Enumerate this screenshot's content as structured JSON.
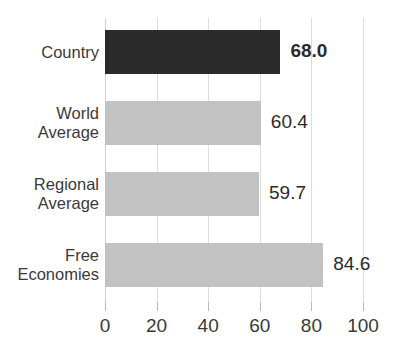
{
  "chart_data": {
    "type": "bar",
    "orientation": "horizontal",
    "title": "",
    "xlabel": "",
    "ylabel": "",
    "xlim": [
      0,
      100
    ],
    "categories": [
      "Country",
      "World Average",
      "Regional Average",
      "Free Economies"
    ],
    "values": [
      68.0,
      60.4,
      59.7,
      84.6
    ],
    "value_labels": [
      "68.0",
      "60.4",
      "59.7",
      "84.6"
    ],
    "xticks": [
      0,
      20,
      40,
      60,
      80,
      100
    ],
    "xtick_labels": [
      "0",
      "20",
      "40",
      "60",
      "80",
      "100"
    ],
    "grid": true,
    "legend": "none",
    "bar_colors": [
      "#2b2b2b",
      "#c2c2c2",
      "#c2c2c2",
      "#c2c2c2"
    ],
    "series": [
      {
        "name": "Score",
        "values": [
          68.0,
          60.4,
          59.7,
          84.6
        ]
      }
    ]
  },
  "chart": {
    "title_cropped": "",
    "bars": [
      {
        "label_lines": [
          "Country"
        ],
        "value_text": "68.0",
        "value": 68.0,
        "emphasis": true,
        "color": "#2b2b2b"
      },
      {
        "label_lines": [
          "World",
          "Average"
        ],
        "value_text": "60.4",
        "value": 60.4,
        "emphasis": false,
        "color": "#c2c2c2"
      },
      {
        "label_lines": [
          "Regional",
          "Average"
        ],
        "value_text": "59.7",
        "value": 59.7,
        "emphasis": false,
        "color": "#c2c2c2"
      },
      {
        "label_lines": [
          "Free",
          "Economies"
        ],
        "value_text": "84.6",
        "value": 84.6,
        "emphasis": false,
        "color": "#c2c2c2"
      }
    ],
    "axis": {
      "ticks": [
        "0",
        "20",
        "40",
        "60",
        "80",
        "100"
      ]
    },
    "colors": {
      "bar_dark": "#2b2b2b",
      "bar_light": "#c2c2c2",
      "gridline": "#dddddd",
      "text": "#3a3a3a",
      "background": "#ffffff"
    }
  }
}
